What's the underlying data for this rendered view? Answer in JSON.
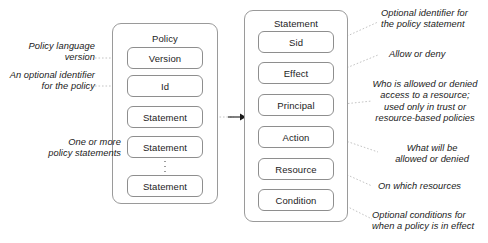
{
  "diagram": {
    "policy": {
      "title": "Policy",
      "fields": [
        {
          "label": "Version"
        },
        {
          "label": "Id"
        },
        {
          "label": "Statement"
        },
        {
          "label": "Statement"
        },
        {
          "label": "Statement"
        }
      ]
    },
    "statement": {
      "title": "Statement",
      "fields": [
        {
          "label": "Sid"
        },
        {
          "label": "Effect"
        },
        {
          "label": "Principal"
        },
        {
          "label": "Action"
        },
        {
          "label": "Resource"
        },
        {
          "label": "Condition"
        }
      ]
    },
    "left_notes": [
      {
        "text": "Policy language\nversion"
      },
      {
        "text": "An optional identifier\nfor the policy"
      },
      {
        "text": "One or more\npolicy statements"
      }
    ],
    "right_notes": [
      {
        "text": "Optional identifier for\nthe policy statement"
      },
      {
        "text": "Allow or deny"
      },
      {
        "text": "Who is allowed or denied\naccess to a resource;\nused only in trust or\nresource-based policies"
      },
      {
        "text": "What will be\nallowed or denied"
      },
      {
        "text": "On which resources"
      },
      {
        "text": "Optional conditions for\nwhen a policy is in effect"
      }
    ],
    "colors": {
      "box_border": "#9a9a9a",
      "field_border": "#8e8e8e",
      "text": "#1a1a1a",
      "leader_line": "#b9b9b9",
      "background": "#ffffff"
    }
  }
}
